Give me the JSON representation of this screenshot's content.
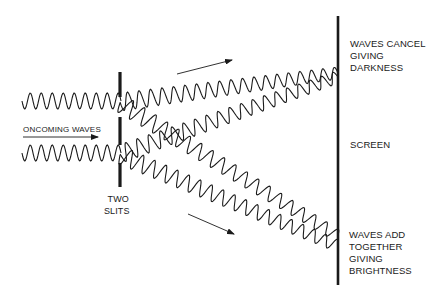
{
  "diagram": {
    "labels": {
      "oncoming": "ONCOMING WAVES",
      "slits_line1": "TWO",
      "slits_line2": "SLITS",
      "cancel_line1": "WAVES CANCEL",
      "cancel_line2": "GIVING",
      "cancel_line3": "DARKNESS",
      "screen": "SCREEN",
      "add_line1": "WAVES ADD",
      "add_line2": "TOGETHER",
      "add_line3": "GIVING",
      "add_line4": "BRIGHTNESS"
    },
    "colors": {
      "ink": "#1a1a1a",
      "background": "#ffffff"
    },
    "elements": {
      "barrier": {
        "x": 120,
        "segments": [
          [
            72,
            97
          ],
          [
            117,
            145
          ],
          [
            163,
            187
          ]
        ]
      },
      "screen": {
        "x": 338,
        "y1": 16,
        "y2": 285
      },
      "incoming_waves": [
        {
          "y": 101,
          "x1": 22,
          "x2": 121,
          "amplitude": 8,
          "wavelength": 11
        },
        {
          "y": 153,
          "x1": 22,
          "x2": 121,
          "amplitude": 8,
          "wavelength": 11
        }
      ],
      "diffracted_waves": [
        {
          "from": [
            120,
            102
          ],
          "to": [
            338,
            73
          ],
          "name": "upper-beam-from-top-slit"
        },
        {
          "from": [
            120,
            154
          ],
          "to": [
            338,
            77
          ],
          "name": "upper-beam-from-bottom-slit"
        },
        {
          "from": [
            120,
            103
          ],
          "to": [
            338,
            236
          ],
          "name": "lower-beam-from-top-slit"
        },
        {
          "from": [
            120,
            155
          ],
          "to": [
            338,
            246
          ],
          "name": "lower-beam-from-bottom-slit"
        }
      ],
      "arrows": [
        {
          "from": [
            177,
            74
          ],
          "to": [
            232,
            60
          ],
          "name": "direction-arrow-upper"
        },
        {
          "from": [
            188,
            214
          ],
          "to": [
            234,
            234
          ],
          "name": "direction-arrow-lower"
        },
        {
          "from": [
            23,
            137
          ],
          "to": [
            98,
            137
          ],
          "name": "oncoming-arrow"
        }
      ]
    }
  }
}
